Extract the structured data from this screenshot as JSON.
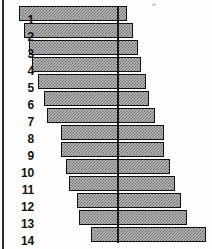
{
  "figure": {
    "title": "",
    "background_color": "#fdfdfd",
    "bar_fill_color": "#b9b9b9",
    "bar_pattern_color": "#6f6f6f",
    "bar_border_color": "#111111",
    "center_line_color": "#1a1a1a",
    "label_color": "#141414",
    "left_rule_color": "#2a2a2a"
  },
  "chart_data": {
    "type": "bar",
    "orientation": "horizontal",
    "title": "",
    "xlabel": "",
    "ylabel": "",
    "grid": false,
    "legend": null,
    "center_reference_value": 0,
    "categories": [
      "1",
      "2",
      "3",
      "4",
      "5",
      "6",
      "7",
      "8",
      "9",
      "10",
      "11",
      "12",
      "13",
      "14"
    ],
    "series": [
      {
        "name": "left",
        "values": [
          -98,
          -93,
          -88,
          -85,
          -79,
          -73,
          -70,
          -56,
          -56,
          -51,
          -48,
          -40,
          -38,
          -26
        ]
      },
      {
        "name": "right",
        "values": [
          10,
          16,
          21,
          24,
          29,
          32,
          38,
          47,
          47,
          53,
          58,
          64,
          70,
          89
        ]
      }
    ],
    "total_lengths": [
      108,
      109,
      109,
      109,
      108,
      105,
      108,
      103,
      103,
      104,
      106,
      104,
      108,
      115
    ],
    "xlim": [
      -100,
      91
    ],
    "tick_labels": []
  },
  "labels": {
    "items": [
      {
        "text": "1"
      },
      {
        "text": "2"
      },
      {
        "text": "3"
      },
      {
        "text": "4"
      },
      {
        "text": "5"
      },
      {
        "text": "6"
      },
      {
        "text": "7"
      },
      {
        "text": "8"
      },
      {
        "text": "9"
      },
      {
        "text": "10"
      },
      {
        "text": "11"
      },
      {
        "text": "12"
      },
      {
        "text": "13"
      },
      {
        "text": "14"
      }
    ]
  },
  "geometry": {
    "center_x": 117,
    "bar_height": 15,
    "row_pitch": 17,
    "first_row_top": 6,
    "bars_px": [
      {
        "left": 19,
        "right": 127
      },
      {
        "left": 24,
        "right": 133
      },
      {
        "left": 29,
        "right": 138
      },
      {
        "left": 32,
        "right": 141
      },
      {
        "left": 38,
        "right": 146
      },
      {
        "left": 44,
        "right": 149
      },
      {
        "left": 47,
        "right": 155
      },
      {
        "left": 61,
        "right": 164
      },
      {
        "left": 61,
        "right": 164
      },
      {
        "left": 66,
        "right": 170
      },
      {
        "left": 69,
        "right": 175
      },
      {
        "left": 77,
        "right": 181
      },
      {
        "left": 79,
        "right": 187
      },
      {
        "left": 91,
        "right": 206
      }
    ],
    "center_line": {
      "x": 117,
      "top": 6,
      "height": 237
    }
  }
}
